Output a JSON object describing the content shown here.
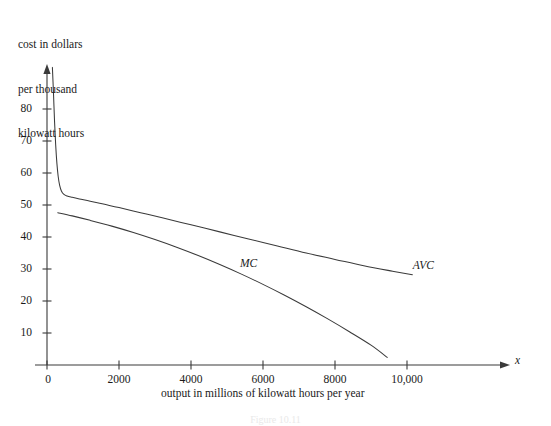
{
  "figure": {
    "caption": "Figure 10.11",
    "background_color": "#ffffff",
    "ink_color": "#3a3a3a"
  },
  "chart_data": {
    "type": "line",
    "title": "",
    "subtitle": "",
    "ylabel_lines": [
      "cost in dollars",
      "per thousand",
      "kilowatt hours"
    ],
    "ylabel": "cost in dollars per thousand kilowatt hours",
    "xlabel": "output in millions of kilowatt hours per year",
    "x_axis_variable": "x",
    "grid": false,
    "legend_position": "inline-annotation",
    "xlim": [
      0,
      10800
    ],
    "ylim": [
      0,
      95
    ],
    "xticks": [
      0,
      2000,
      4000,
      6000,
      8000,
      10000
    ],
    "xtick_labels": [
      "0",
      "2000",
      "4000",
      "6000",
      "8000",
      "10,000"
    ],
    "yticks": [
      10,
      20,
      30,
      40,
      50,
      60,
      70,
      80
    ],
    "ytick_labels": [
      "10",
      "20",
      "30",
      "40",
      "50",
      "60",
      "70",
      "80"
    ],
    "series": [
      {
        "name": "AVC",
        "label": "AVC",
        "label_x": 10550,
        "label_y": 31,
        "points": [
          [
            150,
            93.0
          ],
          [
            180,
            85.0
          ],
          [
            210,
            76.0
          ],
          [
            240,
            69.0
          ],
          [
            275,
            63.0
          ],
          [
            310,
            59.0
          ],
          [
            350,
            56.2
          ],
          [
            400,
            54.4
          ],
          [
            470,
            53.3
          ],
          [
            560,
            52.8
          ],
          [
            700,
            52.4
          ],
          [
            900,
            51.9
          ],
          [
            1200,
            51.2
          ],
          [
            1600,
            50.2
          ],
          [
            2000,
            49.2
          ],
          [
            2600,
            47.6
          ],
          [
            3200,
            46.0
          ],
          [
            4000,
            43.8
          ],
          [
            4800,
            41.6
          ],
          [
            5600,
            39.4
          ],
          [
            6400,
            37.2
          ],
          [
            7200,
            35.0
          ],
          [
            8000,
            33.0
          ],
          [
            8800,
            31.0
          ],
          [
            9600,
            29.3
          ],
          [
            10150,
            28.2
          ]
        ]
      },
      {
        "name": "MC",
        "label": "MC",
        "label_x": 5750,
        "label_y": 31.5,
        "points": [
          [
            300,
            47.6
          ],
          [
            700,
            46.6
          ],
          [
            1200,
            45.2
          ],
          [
            1800,
            43.4
          ],
          [
            2400,
            41.4
          ],
          [
            3000,
            39.2
          ],
          [
            3600,
            36.8
          ],
          [
            4200,
            34.2
          ],
          [
            4800,
            31.4
          ],
          [
            5400,
            28.4
          ],
          [
            6000,
            25.2
          ],
          [
            6600,
            21.8
          ],
          [
            7200,
            18.2
          ],
          [
            7800,
            14.4
          ],
          [
            8400,
            10.4
          ],
          [
            9000,
            6.2
          ],
          [
            9450,
            2.4
          ]
        ]
      }
    ]
  }
}
